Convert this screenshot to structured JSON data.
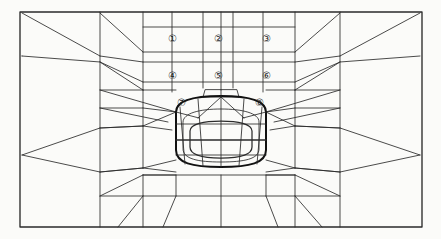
{
  "figure": {
    "type": "fem-mesh-diagram",
    "background_color": "#fbfbf9",
    "line_color": "#2b2b2b",
    "heavy_line_color": "#111111",
    "label_color": "#1d1d1d"
  },
  "domain_boundary": {
    "name": "outer-rectangle",
    "x": 20,
    "y": 12,
    "width": 402,
    "height": 215,
    "stroke_width": 1.3
  },
  "stage_labels": [
    {
      "id": "1",
      "glyph": "①",
      "x": 172,
      "y": 39
    },
    {
      "id": "2",
      "glyph": "②",
      "x": 218,
      "y": 39
    },
    {
      "id": "3",
      "glyph": "③",
      "x": 266,
      "y": 39
    },
    {
      "id": "4",
      "glyph": "④",
      "x": 172,
      "y": 76
    },
    {
      "id": "5",
      "glyph": "⑤",
      "x": 218,
      "y": 76
    },
    {
      "id": "6",
      "glyph": "⑥",
      "x": 266,
      "y": 76
    },
    {
      "id": "7",
      "glyph": "⑦",
      "x": 181,
      "y": 103
    },
    {
      "id": "8",
      "glyph": "⑧",
      "x": 259,
      "y": 103
    }
  ],
  "tunnel": {
    "name": "tunnel-opening",
    "shape": "horseshoe",
    "center_x": 221,
    "crown_y": 97,
    "invert_y": 167,
    "half_width": 45,
    "outline_stroke_width": 2.0
  },
  "mesh": {
    "central_block": {
      "left": 143,
      "right": 295,
      "top": 12,
      "vertical_lines_x": [
        143,
        172,
        203,
        233,
        263,
        293
      ],
      "horizontal_lines_y": [
        12,
        27,
        52,
        62,
        82,
        90
      ]
    },
    "pinch_points": [
      {
        "side": "left",
        "x": 22,
        "y": 155
      },
      {
        "side": "right",
        "x": 420,
        "y": 155
      }
    ],
    "side_columns_x": [
      22,
      100,
      143,
      295,
      340,
      420
    ],
    "lower_fan_base_y": 227,
    "radial_rings": 3,
    "radial_spokes": 7
  }
}
